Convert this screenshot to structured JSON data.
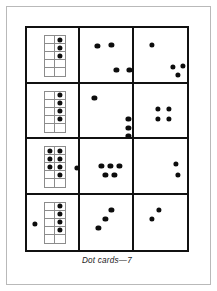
{
  "page": {
    "caption": "Dot cards—7",
    "dot_color": "#0d0d0d",
    "border_color": "#111111",
    "frame_color": "#b9b9b9",
    "tenframe_line_color": "#8c8c8c",
    "background": "#ffffff"
  },
  "table": {
    "rows": 4,
    "columns": 3,
    "cells": [
      {
        "id": "r1c1",
        "type": "ten-frame",
        "count": 3,
        "ten_frame": {
          "columns": 2,
          "rows": 5,
          "filled": [
            [
              0,
              1
            ],
            [
              1,
              1
            ],
            [
              2,
              1
            ]
          ]
        },
        "loose_dots": []
      },
      {
        "id": "r1c2",
        "type": "loose",
        "count": 4,
        "loose_dots": [
          {
            "x": 17,
            "y": 18
          },
          {
            "x": 31,
            "y": 17
          },
          {
            "x": 36,
            "y": 42
          },
          {
            "x": 49,
            "y": 42
          }
        ]
      },
      {
        "id": "r1c3",
        "type": "loose",
        "count": 4,
        "loose_dots": [
          {
            "x": 18,
            "y": 17
          },
          {
            "x": 39,
            "y": 39
          },
          {
            "x": 49,
            "y": 38
          },
          {
            "x": 44,
            "y": 47
          }
        ]
      },
      {
        "id": "r2c1",
        "type": "ten-frame",
        "count": 4,
        "ten_frame": {
          "columns": 2,
          "rows": 5,
          "filled": [
            [
              0,
              1
            ],
            [
              1,
              1
            ],
            [
              2,
              1
            ],
            [
              3,
              1
            ]
          ]
        },
        "loose_dots": []
      },
      {
        "id": "r2c2",
        "type": "loose",
        "count": 4,
        "loose_dots": [
          {
            "x": 14,
            "y": 14
          },
          {
            "x": 48,
            "y": 35
          },
          {
            "x": 48,
            "y": 44
          },
          {
            "x": 48,
            "y": 52
          }
        ]
      },
      {
        "id": "r2c3",
        "type": "loose",
        "count": 4,
        "loose_dots": [
          {
            "x": 24,
            "y": 25
          },
          {
            "x": 35,
            "y": 25
          },
          {
            "x": 24,
            "y": 35
          },
          {
            "x": 35,
            "y": 35
          }
        ]
      },
      {
        "id": "r3c1",
        "type": "ten-frame",
        "count": 8,
        "ten_frame": {
          "columns": 2,
          "rows": 5,
          "filled": [
            [
              0,
              0
            ],
            [
              0,
              1
            ],
            [
              1,
              0
            ],
            [
              1,
              1
            ],
            [
              2,
              0
            ],
            [
              2,
              1
            ],
            [
              3,
              1
            ]
          ]
        },
        "loose_dots": [
          {
            "x": 50,
            "y": 29
          }
        ]
      },
      {
        "id": "r3c2",
        "type": "loose",
        "count": 5,
        "loose_dots": [
          {
            "x": 21,
            "y": 27
          },
          {
            "x": 30,
            "y": 27
          },
          {
            "x": 39,
            "y": 27
          },
          {
            "x": 25,
            "y": 36
          },
          {
            "x": 34,
            "y": 36
          }
        ]
      },
      {
        "id": "r3c3",
        "type": "loose",
        "count": 2,
        "loose_dots": [
          {
            "x": 42,
            "y": 25
          },
          {
            "x": 44,
            "y": 36
          }
        ]
      },
      {
        "id": "r4c1",
        "type": "ten-frame",
        "count": 5,
        "ten_frame": {
          "columns": 2,
          "rows": 5,
          "filled": [
            [
              0,
              1
            ],
            [
              1,
              1
            ],
            [
              2,
              1
            ],
            [
              3,
              1
            ]
          ]
        },
        "loose_dots": [
          {
            "x": 8,
            "y": 29
          }
        ]
      },
      {
        "id": "r4c2",
        "type": "loose",
        "count": 3,
        "loose_dots": [
          {
            "x": 31,
            "y": 15
          },
          {
            "x": 25,
            "y": 24
          },
          {
            "x": 18,
            "y": 33
          }
        ]
      },
      {
        "id": "r4c3",
        "type": "loose",
        "count": 2,
        "loose_dots": [
          {
            "x": 25,
            "y": 15
          },
          {
            "x": 18,
            "y": 24
          }
        ]
      }
    ]
  }
}
